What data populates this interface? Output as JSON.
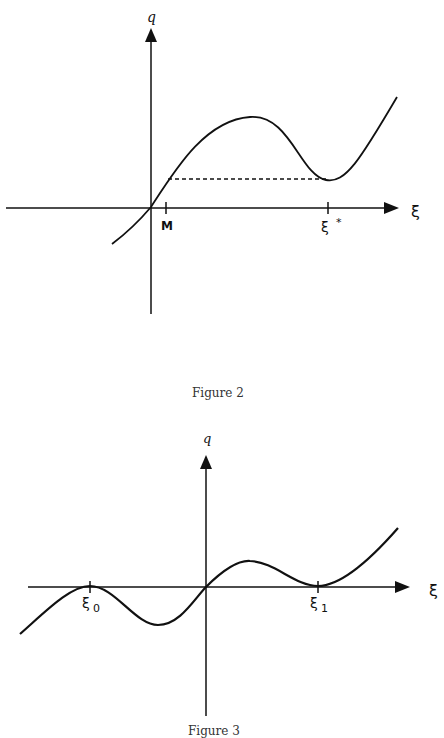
{
  "figure2": {
    "caption": "Figure 2",
    "y_axis_label": "q",
    "x_axis_label": "ξ",
    "tick_labels": {
      "m": "M",
      "xi_star": "ξ",
      "xi_star_sup": "*"
    },
    "curve": "cubic-like curve through origin, local max then local min at ξ*, rising after",
    "dashed_line": "horizontal dashed line from curve near M to local min at ξ*"
  },
  "figure3": {
    "caption": "Figure 3",
    "y_axis_label": "q",
    "x_axis_label": "ξ",
    "tick_labels": {
      "xi0": "ξ",
      "xi0_sub": "0",
      "xi1": "ξ",
      "xi1_sub": "1"
    },
    "curve": "oscillating curve touching axis at ξ0 and ξ1, through origin"
  },
  "colors": {
    "line": "#111111",
    "background": "#ffffff"
  }
}
